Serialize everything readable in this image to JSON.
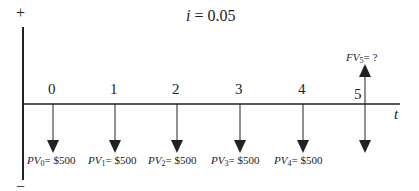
{
  "diagram": {
    "type": "cash-flow timeline",
    "sign_labels": {
      "positive": "+",
      "negative": "−"
    },
    "interest": {
      "symbol": "i",
      "equals": " = ",
      "value": "0.05"
    },
    "axis_label": "t",
    "periods": [
      {
        "label": "0",
        "flow": {
          "name": "PV",
          "sub": "0",
          "eq": "= $500",
          "direction": "down"
        }
      },
      {
        "label": "1",
        "flow": {
          "name": "PV",
          "sub": "1",
          "eq": "= $500",
          "direction": "down"
        }
      },
      {
        "label": "2",
        "flow": {
          "name": "PV",
          "sub": "2",
          "eq": "= $500",
          "direction": "down"
        }
      },
      {
        "label": "3",
        "flow": {
          "name": "PV",
          "sub": "3",
          "eq": "= $500",
          "direction": "down"
        }
      },
      {
        "label": "4",
        "flow": {
          "name": "PV",
          "sub": "4",
          "eq": "= $500",
          "direction": "down"
        }
      },
      {
        "label": "5",
        "flow": {
          "name": "FV",
          "sub": "5",
          "eq": "= ?",
          "direction": "up-and-down"
        }
      }
    ],
    "colors": {
      "line": "#222222",
      "text": "#222222",
      "background": "#ffffff"
    }
  }
}
